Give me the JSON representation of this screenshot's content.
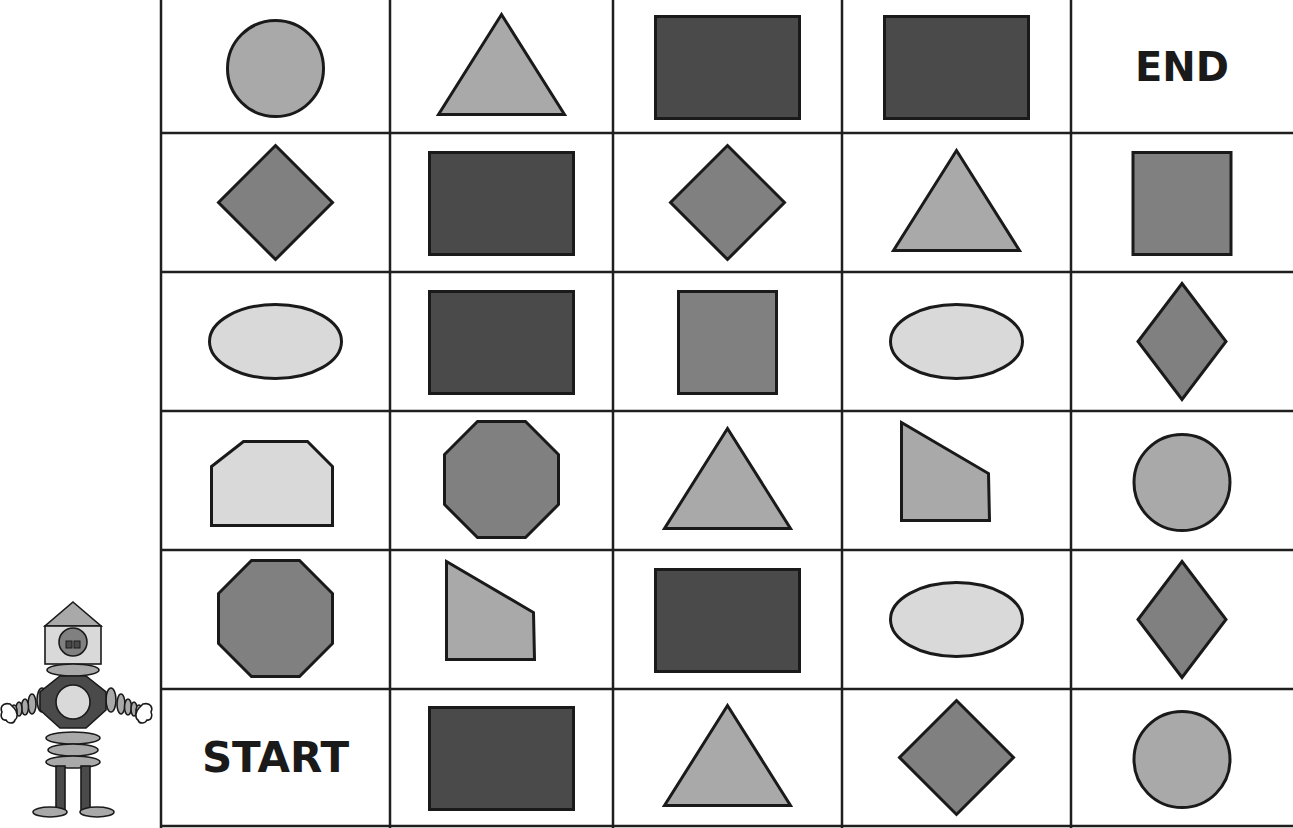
{
  "colors": {
    "grid_line": "#1f1f1f",
    "outline": "#1a1a1a",
    "light": "#d9d9d9",
    "mid_light": "#a9a9a9",
    "medium": "#808080",
    "dark": "#4a4a4a",
    "background": "#ffffff"
  },
  "board": {
    "columns": 5,
    "rows": 6,
    "col_edges": [
      161,
      390,
      613,
      842,
      1071,
      1293
    ],
    "row_edges": [
      0,
      133,
      272,
      411,
      550,
      689,
      826
    ],
    "start_label": "START",
    "end_label": "END",
    "cells": [
      [
        {
          "shape": "circle",
          "fill": "mid_light"
        },
        {
          "shape": "triangle",
          "fill": "mid_light"
        },
        {
          "shape": "rectangle",
          "fill": "dark"
        },
        {
          "shape": "rectangle",
          "fill": "dark"
        },
        {
          "shape": "label",
          "text": "END"
        }
      ],
      [
        {
          "shape": "diamond-wide",
          "fill": "medium"
        },
        {
          "shape": "rectangle",
          "fill": "dark"
        },
        {
          "shape": "diamond-wide",
          "fill": "medium"
        },
        {
          "shape": "triangle",
          "fill": "mid_light"
        },
        {
          "shape": "square",
          "fill": "medium"
        }
      ],
      [
        {
          "shape": "ellipse",
          "fill": "light"
        },
        {
          "shape": "rectangle",
          "fill": "dark"
        },
        {
          "shape": "square",
          "fill": "medium"
        },
        {
          "shape": "ellipse",
          "fill": "light"
        },
        {
          "shape": "diamond",
          "fill": "medium"
        }
      ],
      [
        {
          "shape": "pentagon-house",
          "fill": "light"
        },
        {
          "shape": "octagon",
          "fill": "medium"
        },
        {
          "shape": "triangle",
          "fill": "mid_light"
        },
        {
          "shape": "trapezoid",
          "fill": "mid_light"
        },
        {
          "shape": "circle",
          "fill": "mid_light"
        }
      ],
      [
        {
          "shape": "octagon",
          "fill": "medium"
        },
        {
          "shape": "trapezoid",
          "fill": "mid_light"
        },
        {
          "shape": "rectangle",
          "fill": "dark"
        },
        {
          "shape": "ellipse",
          "fill": "light"
        },
        {
          "shape": "diamond",
          "fill": "medium"
        }
      ],
      [
        {
          "shape": "label",
          "text": "START"
        },
        {
          "shape": "rectangle",
          "fill": "dark"
        },
        {
          "shape": "triangle",
          "fill": "mid_light"
        },
        {
          "shape": "diamond-wide",
          "fill": "medium"
        },
        {
          "shape": "circle",
          "fill": "mid_light"
        }
      ]
    ]
  },
  "robot": {
    "name": "robot-character",
    "parts": [
      "roof-triangle",
      "head-square",
      "face-circle",
      "eyes",
      "neck-ellipse",
      "body-octagon",
      "chest-circle",
      "arm-segments",
      "hands",
      "waist-rings",
      "legs",
      "feet"
    ]
  }
}
